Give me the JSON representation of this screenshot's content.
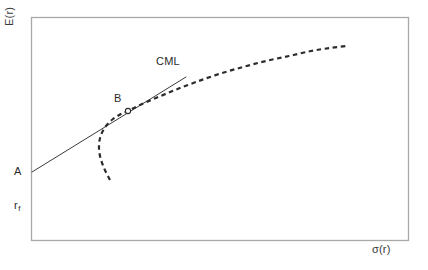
{
  "figure": {
    "background_color": "#ffffff",
    "frame_color": "#a8a8a8",
    "ink_color": "#2b2b2b"
  },
  "labels": {
    "y_axis": "E(r)",
    "x_axis": "σ(r)",
    "intercept_point": "A",
    "risk_free_rate": "r",
    "risk_free_rate_subscript": "f",
    "tangency_point": "B",
    "line_name": "CML"
  },
  "chart_data": {
    "type": "line",
    "title": "",
    "xlabel": "σ(r)",
    "ylabel": "E(r)",
    "grid": false,
    "legend": "none",
    "axis_ticks": "none",
    "xlim": [
      0,
      100
    ],
    "ylim": [
      0,
      100
    ],
    "frame": {
      "x0": 31,
      "y0": 17,
      "x1": 408,
      "y1": 240
    },
    "annotations": [
      {
        "text": "E(r)",
        "role": "y-axis-title",
        "x": 20,
        "y": 28,
        "rotation": -90
      },
      {
        "text": "σ(r)",
        "role": "x-axis-title",
        "x": 388,
        "y": 252,
        "rotation": 0
      },
      {
        "text": "A",
        "role": "point-label",
        "x": 18,
        "y": 172
      },
      {
        "text": "r_f",
        "role": "axis-value-label",
        "x": 18,
        "y": 206
      },
      {
        "text": "B",
        "role": "point-label",
        "x": 118,
        "y": 99
      },
      {
        "text": "CML",
        "role": "series-label",
        "x": 168,
        "y": 62
      }
    ],
    "series": [
      {
        "name": "CML",
        "style": "solid",
        "color": "#3a3a3a",
        "width": 1,
        "description": "Capital Market Line: straight tangent from risk-free point A to the efficient frontier at tangency point B",
        "points": [
          [
            32,
            172
          ],
          [
            186,
            77
          ]
        ]
      },
      {
        "name": "Efficient frontier",
        "style": "dashed",
        "color": "#2b2b2b",
        "width": 2.2,
        "description": "Backward-bending risky-asset opportunity set (hyperbola), tangent to the CML at B",
        "points": [
          [
            110,
            180
          ],
          [
            104,
            168
          ],
          [
            100,
            156
          ],
          [
            99,
            145
          ],
          [
            101,
            135
          ],
          [
            106,
            126
          ],
          [
            113,
            119
          ],
          [
            121,
            114
          ],
          [
            128,
            111
          ],
          [
            140,
            105
          ],
          [
            156,
            98
          ],
          [
            175,
            90
          ],
          [
            196,
            82
          ],
          [
            219,
            74
          ],
          [
            243,
            67
          ],
          [
            266,
            61
          ],
          [
            289,
            56
          ],
          [
            311,
            51
          ],
          [
            330,
            48
          ],
          [
            346,
            46
          ]
        ]
      }
    ],
    "markers": [
      {
        "name": "tangency-point-B",
        "x": 128,
        "y": 111,
        "shape": "circle",
        "filled": false,
        "radius": 2.6,
        "color": "#2b2b2b"
      }
    ]
  }
}
